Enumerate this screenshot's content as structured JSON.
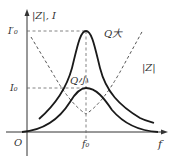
{
  "diagram": {
    "axes": {
      "y_label": "|Z|, I",
      "x_label": "f",
      "origin_label": "O"
    },
    "ticks": {
      "x": [
        {
          "label": "f₀",
          "position": "resonant frequency"
        }
      ],
      "y": [
        {
          "label": "I′₀",
          "position": "peak current, large Q"
        },
        {
          "label": "I₀",
          "position": "peak current, small Q"
        }
      ]
    },
    "curves": [
      {
        "name": "Q大",
        "label": "Q大",
        "style": "solid",
        "description": "current curve, high Q (sharp peak at f₀, value I′₀)"
      },
      {
        "name": "Q小",
        "label": "Q小",
        "style": "solid",
        "description": "current curve, low Q (broad peak at f₀, value I₀)"
      },
      {
        "name": "|Z|",
        "label": "|Z|",
        "style": "dashed",
        "description": "impedance magnitude, minimum at f₀"
      }
    ],
    "colors": {
      "curve": "#1a1a1a",
      "dashed": "#555555",
      "axis": "#333333",
      "text": "#333333"
    }
  }
}
